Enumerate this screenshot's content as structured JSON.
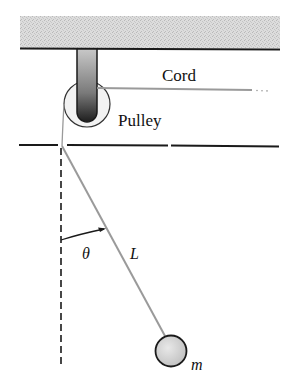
{
  "diagram": {
    "type": "physics-pendulum-pulley",
    "labels": {
      "cord": "Cord",
      "pulley": "Pulley",
      "length": "L",
      "angle": "θ",
      "mass": "m"
    },
    "colors": {
      "ink": "#1a1a1a",
      "ceiling_fill": "#d4d4d4",
      "cord": "#9a9a9a",
      "bob_fill": "#d0d0d0",
      "pulley_fill": "#eeeeee"
    }
  }
}
